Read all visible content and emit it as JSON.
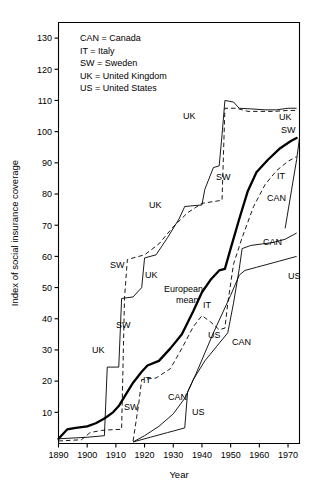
{
  "figure": {
    "title": "",
    "y_axis_title": "Index of social insurance coverage",
    "x_axis_title": "Year"
  },
  "legend": {
    "entries": [
      "CAN = Canada",
      "IT = Italy",
      "SW = Sweden",
      "UK = United Kingdom",
      "US = United States"
    ]
  },
  "axis": {
    "y_ticks": [
      "10",
      "20",
      "30",
      "40",
      "50",
      "60",
      "70",
      "80",
      "90",
      "100",
      "110",
      "120",
      "130"
    ],
    "x_ticks": [
      "1890",
      "1900",
      "1910",
      "1920",
      "1930",
      "1940",
      "1950",
      "1960",
      "1970"
    ]
  },
  "inplot_labels": [
    {
      "text": "UK",
      "x": 183,
      "y": 119
    },
    {
      "text": "UK",
      "x": 279,
      "y": 120
    },
    {
      "text": "SW",
      "x": 281,
      "y": 133
    },
    {
      "text": "IT",
      "x": 277,
      "y": 179
    },
    {
      "text": "CAN",
      "x": 267,
      "y": 201
    },
    {
      "text": "SW",
      "x": 216,
      "y": 180
    },
    {
      "text": "UK",
      "x": 149,
      "y": 208
    },
    {
      "text": "CAN",
      "x": 263,
      "y": 245
    },
    {
      "text": "SW",
      "x": 110,
      "y": 268
    },
    {
      "text": "UK",
      "x": 145,
      "y": 278
    },
    {
      "text": "US",
      "x": 288,
      "y": 279
    },
    {
      "text": "European",
      "x": 164,
      "y": 292
    },
    {
      "text": "mean",
      "x": 176,
      "y": 303
    },
    {
      "text": "IT",
      "x": 203,
      "y": 308
    },
    {
      "text": "SW",
      "x": 116,
      "y": 328
    },
    {
      "text": "US",
      "x": 208,
      "y": 338
    },
    {
      "text": "CAN",
      "x": 232,
      "y": 345
    },
    {
      "text": "UK",
      "x": 92,
      "y": 353
    },
    {
      "text": "IT",
      "x": 143,
      "y": 383
    },
    {
      "text": "CAN",
      "x": 168,
      "y": 400
    },
    {
      "text": "US",
      "x": 192,
      "y": 415
    },
    {
      "text": "SW",
      "x": 124,
      "y": 410
    }
  ],
  "chart_data": {
    "type": "line",
    "title": "Index of social insurance coverage",
    "xlabel": "Year",
    "ylabel": "Index of social insurance coverage",
    "xlim": [
      1890,
      1974
    ],
    "ylim": [
      0,
      135
    ],
    "grid": false,
    "legend_position": "inside-top-left",
    "x_ticks": [
      1890,
      1900,
      1910,
      1920,
      1930,
      1940,
      1950,
      1960,
      1970
    ],
    "y_ticks": [
      10,
      20,
      30,
      40,
      50,
      60,
      70,
      80,
      90,
      100,
      110,
      120,
      130
    ],
    "series": [
      {
        "name": "UK",
        "label": "United Kingdom",
        "style": "solid-thin",
        "points": [
          [
            1890,
            1.5
          ],
          [
            1900,
            2.0
          ],
          [
            1906,
            2.5
          ],
          [
            1907,
            24.5
          ],
          [
            1911,
            24.5
          ],
          [
            1912,
            46.5
          ],
          [
            1916,
            47.0
          ],
          [
            1919,
            50.0
          ],
          [
            1920,
            59.5
          ],
          [
            1924,
            60.5
          ],
          [
            1928,
            66.0
          ],
          [
            1932,
            72.0
          ],
          [
            1934,
            76.0
          ],
          [
            1940,
            76.5
          ],
          [
            1941,
            81.5
          ],
          [
            1944,
            88.5
          ],
          [
            1946,
            89.0
          ],
          [
            1947,
            99.0
          ],
          [
            1948,
            110.0
          ],
          [
            1951,
            109.5
          ],
          [
            1953,
            107.5
          ],
          [
            1957,
            107.3
          ],
          [
            1962,
            107.0
          ],
          [
            1966,
            107.0
          ],
          [
            1970,
            107.5
          ],
          [
            1973,
            107.5
          ]
        ]
      },
      {
        "name": "SW",
        "label": "Sweden",
        "style": "dashed",
        "points": [
          [
            1890,
            0.8
          ],
          [
            1898,
            1.2
          ],
          [
            1901,
            3.5
          ],
          [
            1905,
            4.2
          ],
          [
            1910,
            4.5
          ],
          [
            1912,
            4.5
          ],
          [
            1913,
            46.5
          ],
          [
            1914,
            59.0
          ],
          [
            1916,
            59.5
          ],
          [
            1920,
            60.5
          ],
          [
            1925,
            64.0
          ],
          [
            1930,
            69.5
          ],
          [
            1935,
            74.0
          ],
          [
            1940,
            77.0
          ],
          [
            1947,
            78.0
          ],
          [
            1948,
            107.5
          ],
          [
            1952,
            107.5
          ],
          [
            1956,
            106.5
          ],
          [
            1960,
            106.5
          ],
          [
            1965,
            106.5
          ],
          [
            1970,
            106.8
          ],
          [
            1973,
            106.8
          ]
        ]
      },
      {
        "name": "European mean",
        "label": "European mean",
        "style": "solid-bold",
        "points": [
          [
            1890,
            1.5
          ],
          [
            1893,
            4.5
          ],
          [
            1896,
            5.0
          ],
          [
            1900,
            5.5
          ],
          [
            1903,
            6.5
          ],
          [
            1906,
            8.0
          ],
          [
            1909,
            10.0
          ],
          [
            1911,
            12.0
          ],
          [
            1913,
            15.0
          ],
          [
            1916,
            19.5
          ],
          [
            1919,
            23.0
          ],
          [
            1921,
            25.0
          ],
          [
            1925,
            26.5
          ],
          [
            1929,
            30.5
          ],
          [
            1933,
            35.0
          ],
          [
            1937,
            42.5
          ],
          [
            1940,
            48.5
          ],
          [
            1943,
            52.5
          ],
          [
            1946,
            55.5
          ],
          [
            1948,
            56.0
          ],
          [
            1950,
            62.5
          ],
          [
            1953,
            72.0
          ],
          [
            1956,
            81.0
          ],
          [
            1959,
            87.0
          ],
          [
            1963,
            91.0
          ],
          [
            1967,
            94.5
          ],
          [
            1971,
            97.0
          ],
          [
            1973,
            98.0
          ]
        ]
      },
      {
        "name": "IT",
        "label": "Italy",
        "style": "dashed",
        "points": [
          [
            1916,
            0.8
          ],
          [
            1918,
            13.0
          ],
          [
            1919,
            20.5
          ],
          [
            1924,
            21.0
          ],
          [
            1929,
            24.0
          ],
          [
            1933,
            30.5
          ],
          [
            1937,
            37.5
          ],
          [
            1940,
            41.0
          ],
          [
            1943,
            39.0
          ],
          [
            1946,
            36.5
          ],
          [
            1948,
            37.0
          ],
          [
            1949,
            45.0
          ],
          [
            1951,
            57.5
          ],
          [
            1954,
            66.0
          ],
          [
            1958,
            76.0
          ],
          [
            1962,
            83.0
          ],
          [
            1966,
            87.5
          ],
          [
            1970,
            90.5
          ],
          [
            1973,
            92.0
          ]
        ]
      },
      {
        "name": "CAN",
        "label": "Canada",
        "style": "solid-thin",
        "points": [
          [
            1916,
            0.5
          ],
          [
            1920,
            2.5
          ],
          [
            1925,
            5.5
          ],
          [
            1930,
            9.5
          ],
          [
            1934,
            14.5
          ],
          [
            1937,
            20.5
          ],
          [
            1941,
            26.5
          ],
          [
            1945,
            31.0
          ],
          [
            1949,
            35.5
          ],
          [
            1951,
            45.0
          ],
          [
            1953,
            56.0
          ],
          [
            1954,
            62.5
          ],
          [
            1957,
            63.5
          ],
          [
            1961,
            64.0
          ],
          [
            1965,
            64.5
          ],
          [
            1969,
            65.5
          ],
          [
            1972,
            67.0
          ],
          [
            1973,
            67.5
          ]
        ]
      },
      {
        "name": "US",
        "label": "United States",
        "style": "solid-thin",
        "points": [
          [
            1916,
            0.5
          ],
          [
            1922,
            2.0
          ],
          [
            1928,
            3.5
          ],
          [
            1932,
            4.5
          ],
          [
            1934,
            5.0
          ],
          [
            1935,
            16.5
          ],
          [
            1938,
            22.5
          ],
          [
            1941,
            29.0
          ],
          [
            1944,
            35.5
          ],
          [
            1947,
            41.5
          ],
          [
            1950,
            47.5
          ],
          [
            1953,
            54.0
          ],
          [
            1955,
            55.5
          ],
          [
            1959,
            56.5
          ],
          [
            1963,
            57.5
          ],
          [
            1967,
            58.5
          ],
          [
            1971,
            59.5
          ],
          [
            1973,
            60.0
          ]
        ]
      },
      {
        "name": "rising-right-edge",
        "label": "",
        "style": "solid-thin",
        "points": [
          [
            1969,
            69.0
          ],
          [
            1971,
            80.0
          ],
          [
            1973,
            91.0
          ],
          [
            1974,
            98.0
          ]
        ]
      }
    ]
  }
}
